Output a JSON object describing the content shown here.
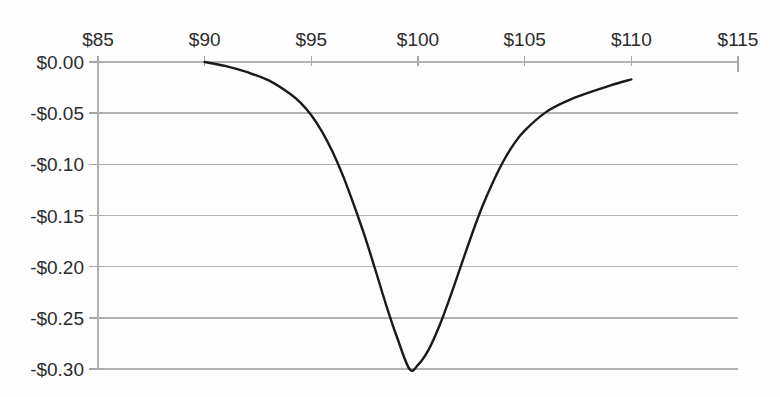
{
  "chart_data": {
    "type": "line",
    "title": "",
    "subtitle": "",
    "xlabel": "",
    "ylabel": "",
    "xlim": [
      85,
      115
    ],
    "ylim": [
      -0.3,
      0.0
    ],
    "grid": true,
    "legend": null,
    "x_axis_position": "top",
    "x_tick_labels": [
      "$85",
      "$90",
      "$95",
      "$100",
      "$105",
      "$110",
      "$115"
    ],
    "x_ticks": [
      85,
      90,
      95,
      100,
      105,
      110,
      115
    ],
    "y_tick_labels": [
      "$0.00",
      "-$0.05",
      "-$0.10",
      "-$0.15",
      "-$0.20",
      "-$0.25",
      "-$0.30"
    ],
    "y_ticks": [
      0.0,
      -0.05,
      -0.1,
      -0.15,
      -0.2,
      -0.25,
      -0.3
    ],
    "series": [
      {
        "name": "value",
        "color": "#1a1a1a",
        "x": [
          90.0,
          91.0,
          92.0,
          93.0,
          94.0,
          94.5,
          95.0,
          95.5,
          96.0,
          96.5,
          97.0,
          97.5,
          98.0,
          98.5,
          99.0,
          99.6,
          100.0,
          100.5,
          101.0,
          101.5,
          102.0,
          102.5,
          103.0,
          103.5,
          104.0,
          104.5,
          105.0,
          106.0,
          107.0,
          108.0,
          109.0,
          110.0
        ],
        "y": [
          0.0,
          -0.004,
          -0.01,
          -0.018,
          -0.031,
          -0.04,
          -0.052,
          -0.068,
          -0.088,
          -0.112,
          -0.14,
          -0.17,
          -0.203,
          -0.237,
          -0.268,
          -0.3,
          -0.296,
          -0.281,
          -0.258,
          -0.23,
          -0.2,
          -0.17,
          -0.142,
          -0.118,
          -0.097,
          -0.08,
          -0.067,
          -0.049,
          -0.038,
          -0.03,
          -0.023,
          -0.017
        ]
      }
    ],
    "notes": {
      "minimum_value": "-$0.30",
      "minimum_x": "$100",
      "left_endpoint_x": "$90",
      "right_endpoint_x": "$110"
    }
  },
  "colors": {
    "curve": "#1a1a1a",
    "gridline": "#b3b3b3",
    "axis": "#b0b0b0",
    "tick_text": "#2b2b2b",
    "background": "#fefefe"
  }
}
